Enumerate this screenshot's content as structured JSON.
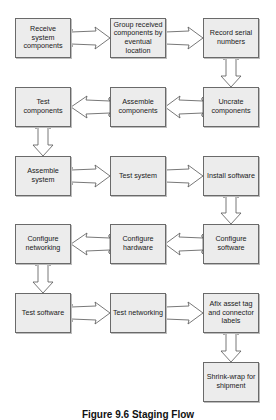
{
  "diagram": {
    "type": "flowchart",
    "caption": "Figure 9.6 Staging Flow",
    "colors": {
      "box_fill": "#ececec",
      "box_border": "#6a6a6a",
      "arrow_stroke": "#555555"
    },
    "steps": [
      {
        "id": 1,
        "label": "Receive system components"
      },
      {
        "id": 2,
        "label": "Group received components by eventual location"
      },
      {
        "id": 3,
        "label": "Record serial numbers"
      },
      {
        "id": 4,
        "label": "Uncrate components"
      },
      {
        "id": 5,
        "label": "Assemble components"
      },
      {
        "id": 6,
        "label": "Test components"
      },
      {
        "id": 7,
        "label": "Assemble system"
      },
      {
        "id": 8,
        "label": "Test system"
      },
      {
        "id": 9,
        "label": "Install software"
      },
      {
        "id": 10,
        "label": "Configure software"
      },
      {
        "id": 11,
        "label": "Configure hardware"
      },
      {
        "id": 12,
        "label": "Configure networking"
      },
      {
        "id": 13,
        "label": "Test software"
      },
      {
        "id": 14,
        "label": "Test networking"
      },
      {
        "id": 15,
        "label": "Afix asset tag and connector labels"
      },
      {
        "id": 16,
        "label": "Shrink-wrap for shipment"
      }
    ],
    "edges": [
      [
        1,
        2
      ],
      [
        2,
        3
      ],
      [
        3,
        4
      ],
      [
        4,
        5
      ],
      [
        5,
        6
      ],
      [
        6,
        7
      ],
      [
        7,
        8
      ],
      [
        8,
        9
      ],
      [
        9,
        10
      ],
      [
        10,
        11
      ],
      [
        11,
        12
      ],
      [
        12,
        13
      ],
      [
        13,
        14
      ],
      [
        14,
        15
      ],
      [
        15,
        16
      ]
    ]
  }
}
